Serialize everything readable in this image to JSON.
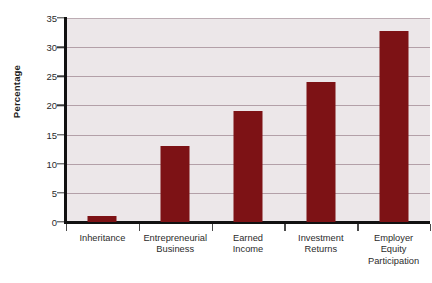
{
  "chart_data": {
    "type": "bar",
    "title": "",
    "xlabel": "",
    "ylabel": "Percentage",
    "categories": [
      "Inheritance",
      "Entrepreneurial Business",
      "Earned Income",
      "Investment Returns",
      "Employer Equity Participation"
    ],
    "category_lines": [
      [
        "Inheritance"
      ],
      [
        "Entrepreneurial",
        "Business"
      ],
      [
        "Earned",
        "Income"
      ],
      [
        "Investment",
        "Returns"
      ],
      [
        "Employer",
        "Equity",
        "Participation"
      ]
    ],
    "values": [
      1,
      13,
      19,
      24,
      32.7
    ],
    "ylim": [
      0,
      35
    ],
    "ytick_values": [
      0,
      5,
      10,
      15,
      20,
      25,
      30,
      35
    ],
    "ytick_labels": [
      "0",
      "5",
      "10",
      "15",
      "20",
      "25",
      "30",
      "35"
    ],
    "grid": true,
    "grid_orientation": "horizontal",
    "legend": "none",
    "bar_color": "#7d1215",
    "plot_background": "#ece7e9",
    "gridline_color": "#b3a0a8",
    "axis_color": "#111111",
    "page_background": "#ffffff"
  }
}
